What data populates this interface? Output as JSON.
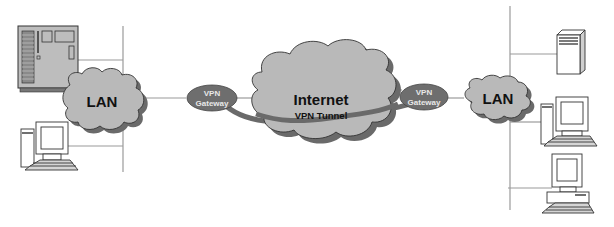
{
  "diagram": {
    "type": "vpn-network-topology",
    "nodes": {
      "left_lan": {
        "label": "LAN"
      },
      "left_gateway": {
        "line1": "VPN",
        "line2": "Gateway"
      },
      "internet": {
        "label": "Internet",
        "tunnel_label": "VPN Tunnel"
      },
      "right_gateway": {
        "line1": "VPN",
        "line2": "Gateway"
      },
      "right_lan": {
        "label": "LAN"
      }
    },
    "devices": {
      "left": [
        "mainframe-server",
        "desktop-pc"
      ],
      "right": [
        "tower-server",
        "desktop-pc",
        "desktop-pc"
      ]
    },
    "colors": {
      "cloud_fill": "#b9b9b9",
      "cloud_shadow": "#6a6a6a",
      "gateway_fill": "#6e6e6e",
      "tunnel": "#6a6a6a",
      "line": "#9a9a9a"
    }
  }
}
